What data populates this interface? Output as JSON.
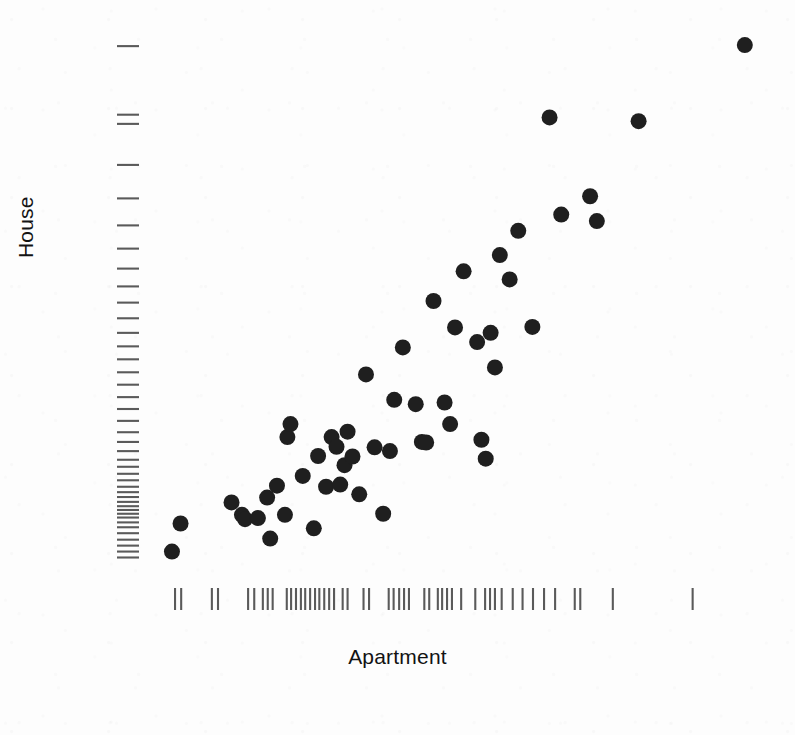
{
  "figure": {
    "width": 795,
    "height": 735,
    "background_color": "#fdfdfd",
    "point_color": "#1f1f1f",
    "rug_color": "#5a5a5a"
  },
  "chart_data": {
    "type": "scatter",
    "title": "",
    "subtitle": "",
    "xlabel": "Apartment",
    "ylabel": "House",
    "grid": false,
    "legend": null,
    "axis_ticks_shown": false,
    "marginal_rugs": true,
    "xlim": [
      0,
      1
    ],
    "ylim": [
      0,
      1
    ],
    "note": "Values are normalized fractional positions within the plotting panel (0 = left/bottom edge of data region, 1 = right/top edge); the printed figure shows no numeric tick labels.",
    "points": [
      {
        "x": 0.026,
        "y": 0.036
      },
      {
        "x": 0.04,
        "y": 0.088
      },
      {
        "x": 0.123,
        "y": 0.127
      },
      {
        "x": 0.14,
        "y": 0.104
      },
      {
        "x": 0.145,
        "y": 0.096
      },
      {
        "x": 0.166,
        "y": 0.098
      },
      {
        "x": 0.181,
        "y": 0.136
      },
      {
        "x": 0.186,
        "y": 0.06
      },
      {
        "x": 0.197,
        "y": 0.158
      },
      {
        "x": 0.21,
        "y": 0.104
      },
      {
        "x": 0.214,
        "y": 0.248
      },
      {
        "x": 0.219,
        "y": 0.272
      },
      {
        "x": 0.239,
        "y": 0.176
      },
      {
        "x": 0.257,
        "y": 0.079
      },
      {
        "x": 0.264,
        "y": 0.213
      },
      {
        "x": 0.277,
        "y": 0.156
      },
      {
        "x": 0.286,
        "y": 0.248
      },
      {
        "x": 0.294,
        "y": 0.23
      },
      {
        "x": 0.3,
        "y": 0.16
      },
      {
        "x": 0.307,
        "y": 0.196
      },
      {
        "x": 0.312,
        "y": 0.258
      },
      {
        "x": 0.32,
        "y": 0.212
      },
      {
        "x": 0.331,
        "y": 0.142
      },
      {
        "x": 0.342,
        "y": 0.364
      },
      {
        "x": 0.356,
        "y": 0.229
      },
      {
        "x": 0.37,
        "y": 0.106
      },
      {
        "x": 0.381,
        "y": 0.222
      },
      {
        "x": 0.388,
        "y": 0.317
      },
      {
        "x": 0.402,
        "y": 0.414
      },
      {
        "x": 0.423,
        "y": 0.309
      },
      {
        "x": 0.433,
        "y": 0.239
      },
      {
        "x": 0.44,
        "y": 0.238
      },
      {
        "x": 0.452,
        "y": 0.5
      },
      {
        "x": 0.47,
        "y": 0.312
      },
      {
        "x": 0.479,
        "y": 0.272
      },
      {
        "x": 0.487,
        "y": 0.451
      },
      {
        "x": 0.501,
        "y": 0.555
      },
      {
        "x": 0.523,
        "y": 0.424
      },
      {
        "x": 0.53,
        "y": 0.243
      },
      {
        "x": 0.537,
        "y": 0.208
      },
      {
        "x": 0.545,
        "y": 0.441
      },
      {
        "x": 0.552,
        "y": 0.377
      },
      {
        "x": 0.56,
        "y": 0.585
      },
      {
        "x": 0.576,
        "y": 0.54
      },
      {
        "x": 0.59,
        "y": 0.63
      },
      {
        "x": 0.613,
        "y": 0.452
      },
      {
        "x": 0.641,
        "y": 0.84
      },
      {
        "x": 0.66,
        "y": 0.66
      },
      {
        "x": 0.707,
        "y": 0.694
      },
      {
        "x": 0.718,
        "y": 0.648
      },
      {
        "x": 0.786,
        "y": 0.833
      },
      {
        "x": 0.959,
        "y": 0.974
      }
    ],
    "x_rug": [
      0.031,
      0.041,
      0.091,
      0.101,
      0.15,
      0.16,
      0.174,
      0.182,
      0.19,
      0.213,
      0.22,
      0.228,
      0.236,
      0.243,
      0.251,
      0.259,
      0.266,
      0.274,
      0.282,
      0.29,
      0.304,
      0.312,
      0.338,
      0.347,
      0.379,
      0.387,
      0.396,
      0.404,
      0.412,
      0.437,
      0.445,
      0.459,
      0.466,
      0.474,
      0.482,
      0.497,
      0.52,
      0.536,
      0.544,
      0.552,
      0.563,
      0.581,
      0.597,
      0.614,
      0.632,
      0.65,
      0.682,
      0.691,
      0.744,
      0.874
    ],
    "y_rug": [
      0.025,
      0.036,
      0.047,
      0.058,
      0.07,
      0.081,
      0.09,
      0.099,
      0.106,
      0.113,
      0.12,
      0.128,
      0.137,
      0.146,
      0.156,
      0.168,
      0.18,
      0.193,
      0.206,
      0.222,
      0.239,
      0.257,
      0.278,
      0.3,
      0.322,
      0.345,
      0.368,
      0.392,
      0.416,
      0.441,
      0.468,
      0.497,
      0.527,
      0.56,
      0.597,
      0.64,
      0.69,
      0.752,
      0.828,
      0.845,
      0.972
    ]
  },
  "labels": {
    "x_axis": "Apartment",
    "y_axis": "House"
  }
}
